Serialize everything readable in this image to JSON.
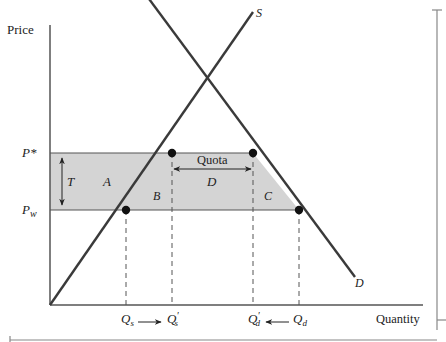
{
  "diagram": {
    "axes": {
      "y_label": "Price",
      "x_label": "Quantity"
    },
    "price_levels": {
      "p_star": "P*",
      "p_world_base": "P",
      "p_world_sub": "w"
    },
    "curves": {
      "supply": "S",
      "demand": "D"
    },
    "regions": {
      "a": "A",
      "b": "B",
      "c": "C",
      "d": "D",
      "tariff": "T",
      "quota": "Quota"
    },
    "quantities": {
      "qs_base": "Q",
      "qs_sub": "s",
      "qs_prime_base": "Q",
      "qs_prime_sub": "s",
      "qs_prime_mark": "′",
      "qd_prime_base": "Q",
      "qd_prime_sub": "d",
      "qd_prime_mark": "′",
      "qd_base": "Q",
      "qd_sub": "d"
    },
    "colors": {
      "shaded_region": "#d4d4d4",
      "line": "#3a3a3a",
      "axis": "#555555",
      "dashed": "#555555",
      "point": "#111111"
    }
  }
}
